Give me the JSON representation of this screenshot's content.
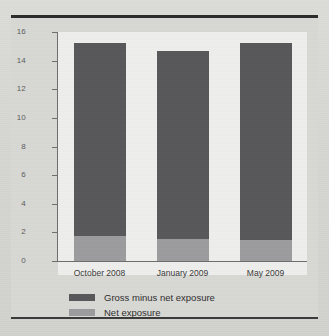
{
  "chart_data": {
    "type": "bar",
    "subtype": "stacked-vertical",
    "title": "",
    "subtitle": "",
    "xlabel": "",
    "ylabel": "",
    "categories": [
      "October 2008",
      "January 2009",
      "May 2009"
    ],
    "series": [
      {
        "name": "Net exposure",
        "color": "#9c9c9e",
        "values": [
          1.75,
          1.55,
          1.5
        ]
      },
      {
        "name": "Gross minus net exposure",
        "color": "#58585a",
        "values": [
          13.5,
          13.15,
          13.75
        ]
      }
    ],
    "stack_totals": [
      15.25,
      14.7,
      15.25
    ],
    "stack_order": [
      "Net exposure",
      "Gross minus net exposure"
    ],
    "ylim": [
      0,
      16
    ],
    "yticks": [
      0,
      2,
      4,
      6,
      8,
      10,
      12,
      14,
      16
    ],
    "ytick_labels": [
      "0",
      "2",
      "4",
      "6",
      "8",
      "10",
      "12",
      "14",
      "16"
    ],
    "grid": false,
    "legend_position": "bottom-center",
    "legend_entries": [
      {
        "label": "Gross minus net exposure",
        "color": "#58585a"
      },
      {
        "label": "Net exposure",
        "color": "#9c9c9e"
      }
    ],
    "plot_background": "#eeeeec",
    "figure_background": "#d8d8d4"
  }
}
